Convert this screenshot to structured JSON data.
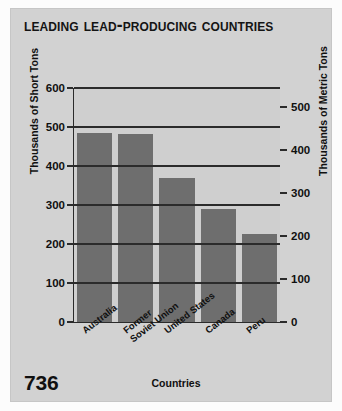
{
  "page_number": "736",
  "chart_data": {
    "type": "bar",
    "title": "Leading Lead-Producing Countries",
    "xlabel": "Countries",
    "ylabel": "Thousands of Short Tons",
    "ylabel_secondary": "Thousands of Metric Tons",
    "categories": [
      "Australia",
      "Former Soviet Union",
      "United States",
      "Canada",
      "Peru"
    ],
    "category_lines": [
      [
        "Australia"
      ],
      [
        "Former",
        "Soviet Union"
      ],
      [
        "United States"
      ],
      [
        "Canada"
      ],
      [
        "Peru"
      ]
    ],
    "values": [
      485,
      483,
      370,
      290,
      225
    ],
    "values_metric": [
      440,
      438,
      336,
      263,
      204
    ],
    "ylim": [
      0,
      600
    ],
    "yticks": [
      0,
      100,
      200,
      300,
      400,
      500,
      600
    ],
    "ytick_labels": [
      "0",
      "100",
      "200",
      "300",
      "400",
      "500",
      "600"
    ],
    "ylim_secondary": [
      0,
      544
    ],
    "yticks_secondary": [
      0,
      100,
      200,
      300,
      400,
      500
    ],
    "ytick_labels_secondary": [
      "0",
      "100",
      "200",
      "300",
      "400",
      "500"
    ],
    "grid": true,
    "legend": false,
    "bar_color": "#6e6e6e",
    "plot_background": "#cfcfcf",
    "panel_background": "#d2d2d2",
    "axis_color": "#2b2b2b"
  }
}
